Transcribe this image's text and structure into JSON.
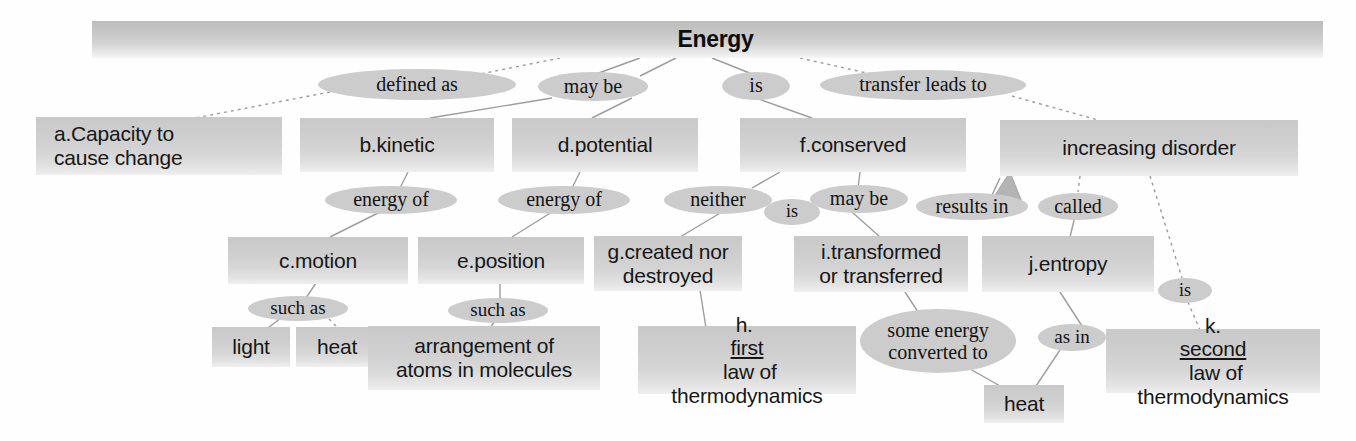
{
  "banner": {
    "title": "Energy"
  },
  "colors": {
    "box_fill": "#d2d2d2",
    "ellipse_fill": "#cccccc",
    "text": "#161616",
    "line": "#9a9a9a"
  },
  "concepts": [
    {
      "id": "a",
      "label": "a.Capacity to\ncause change"
    },
    {
      "id": "b",
      "label": "b.kinetic"
    },
    {
      "id": "d",
      "label": "d.potential"
    },
    {
      "id": "f",
      "label": "f.conserved"
    },
    {
      "id": "disorder",
      "label": "increasing disorder"
    },
    {
      "id": "c",
      "label": "c.motion"
    },
    {
      "id": "e",
      "label": "e.position"
    },
    {
      "id": "g",
      "label": "g.created nor\ndestroyed"
    },
    {
      "id": "i",
      "label": "i.transformed\nor transferred"
    },
    {
      "id": "j",
      "label": "j.entropy"
    },
    {
      "id": "light",
      "label": "light"
    },
    {
      "id": "heat1",
      "label": "heat"
    },
    {
      "id": "arrangement",
      "label": "arrangement of\natoms in molecules"
    },
    {
      "id": "h",
      "label_pre": "h. ",
      "label_underline": "first",
      "label_post": " law of\nthermodynamics"
    },
    {
      "id": "heat2",
      "label": "heat"
    },
    {
      "id": "k",
      "label_pre": "k.",
      "label_underline": "second",
      "label_post": " law of\nthermodynamics"
    }
  ],
  "linking_phrases": [
    {
      "id": "defined_as",
      "label": "defined as"
    },
    {
      "id": "may_be_1",
      "label": "may  be"
    },
    {
      "id": "is_1",
      "label": "is"
    },
    {
      "id": "transfer_leads_to",
      "label": "transfer leads to"
    },
    {
      "id": "energy_of_1",
      "label": "energy of"
    },
    {
      "id": "energy_of_2",
      "label": "energy of"
    },
    {
      "id": "neither",
      "label": "neither"
    },
    {
      "id": "is_2",
      "label": "is"
    },
    {
      "id": "may_be_2",
      "label": "may be"
    },
    {
      "id": "results_in",
      "label": "results in"
    },
    {
      "id": "called",
      "label": "called"
    },
    {
      "id": "such_as_1",
      "label": "such as"
    },
    {
      "id": "such_as_2",
      "label": "such as"
    },
    {
      "id": "some_energy_converted_to",
      "label": "some energy\nconverted to"
    },
    {
      "id": "as_in",
      "label": "as in"
    },
    {
      "id": "is_3",
      "label": "is"
    }
  ],
  "nodes": {
    "a": {
      "text": "a.Capacity to cause change",
      "line1": "a.Capacity to",
      "line2": "cause change"
    },
    "b": {
      "text": "b.kinetic"
    },
    "d": {
      "text": "d.potential"
    },
    "f": {
      "text": "f.conserved"
    },
    "disorder": {
      "text": "increasing disorder"
    },
    "c": {
      "text": "c.motion"
    },
    "e": {
      "text": "e.position"
    },
    "g": {
      "line1": "g.created nor",
      "line2": "destroyed"
    },
    "i": {
      "line1": "i.transformed",
      "line2": "or transferred"
    },
    "j": {
      "text": "j.entropy"
    },
    "light": {
      "text": "light"
    },
    "heat1": {
      "text": "heat"
    },
    "arrangement": {
      "line1": "arrangement of",
      "line2": "atoms in molecules"
    },
    "h": {
      "pre": "h. ",
      "underline": "first",
      "post": " law of",
      "line2": "thermodynamics"
    },
    "heat2": {
      "text": "heat"
    },
    "k": {
      "pre": "k.",
      "underline": "second",
      "post": " law of",
      "line2": "thermodynamics"
    }
  },
  "phrases": {
    "defined_as": {
      "text": "defined as"
    },
    "may_be_1": {
      "text": "may  be"
    },
    "is_1": {
      "text": "is"
    },
    "transfer_leads_to": {
      "text": "transfer leads to"
    },
    "energy_of_1": {
      "text": "energy of"
    },
    "energy_of_2": {
      "text": "energy of"
    },
    "neither": {
      "text": "neither"
    },
    "is_2": {
      "text": "is"
    },
    "may_be_2": {
      "text": "may be"
    },
    "results_in": {
      "text": "results in"
    },
    "called": {
      "text": "called"
    },
    "such_as_1": {
      "text": "such as"
    },
    "such_as_2": {
      "text": "such as"
    },
    "some_energy_line1": {
      "text": "some energy"
    },
    "some_energy_line2": {
      "text": "converted to"
    },
    "as_in": {
      "text": "as in"
    },
    "is_3": {
      "text": "is"
    }
  }
}
